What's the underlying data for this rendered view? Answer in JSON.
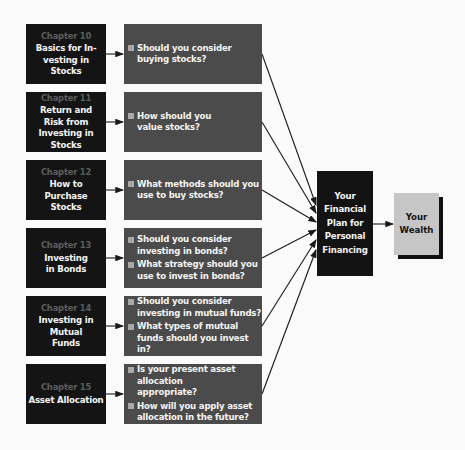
{
  "chapters": [
    {
      "number": "Chapter 10",
      "title": "Basics for In- vesting in Stocks",
      "questions": [
        "Should you consider buying stocks?"
      ]
    },
    {
      "number": "Chapter 11",
      "title": "Return and Risk from Investing in Stocks",
      "questions": [
        "How should you value stocks?"
      ]
    },
    {
      "number": "Chapter 12",
      "title": "How to Purchase Stocks",
      "questions": [
        "What methods should you use to buy stocks?"
      ]
    },
    {
      "number": "Chapter 13",
      "title": "Investing in Bonds",
      "questions": [
        "Should you consider investing in bonds?",
        "What strategy should you use to invest in bonds?"
      ]
    },
    {
      "number": "Chapter 14",
      "title": "Investing in Mutual Funds",
      "questions": [
        "Should you consider investing in mutual funds?",
        "What types of mutual funds should you invest in?"
      ]
    },
    {
      "number": "Chapter 15",
      "title": "Asset Allocation",
      "questions": [
        "Is your present asset allocation appropriate?",
        "How will you apply asset allocation in the future?"
      ]
    }
  ],
  "plan": {
    "label": "Your Financial Plan for Personal Financing"
  },
  "wealth": {
    "label": "Your Wealth"
  },
  "colors": {
    "chapter_box": "#141414",
    "question_box": "#4b4b4b",
    "plan_box": "#131313",
    "wealth_box": "#c6c6c6",
    "chapter_number": "#5d5d5d",
    "bullet": "#a9a9a9"
  }
}
